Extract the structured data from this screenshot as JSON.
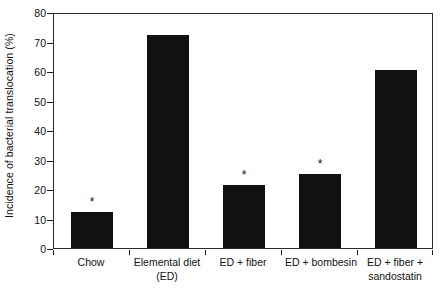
{
  "chart_data": {
    "type": "bar",
    "title": "",
    "xlabel": "",
    "ylabel": "Incidence of bacterial translocation (%)",
    "ylim": [
      0,
      80
    ],
    "yticks": [
      "0",
      "10",
      "20",
      "30",
      "40",
      "50",
      "60",
      "70",
      "80"
    ],
    "grid": false,
    "legend": "none",
    "categories": [
      "Chow",
      "Elemental diet (ED)",
      "ED + fiber",
      "ED + bombesin",
      "ED + fiber + sandostatin"
    ],
    "category_lines": [
      [
        "Chow"
      ],
      [
        "Elemental diet",
        "(ED)"
      ],
      [
        "ED + fiber"
      ],
      [
        "ED + bombesin"
      ],
      [
        "ED + fiber +",
        "sandostatin"
      ]
    ],
    "values": [
      12.3,
      72.2,
      21.3,
      25.0,
      60.3
    ],
    "annotations": [
      "*",
      "",
      "*",
      "*",
      ""
    ],
    "annotation_symbol": "*",
    "bar_color": "#111111",
    "axis_color": "#2a2a2a"
  }
}
